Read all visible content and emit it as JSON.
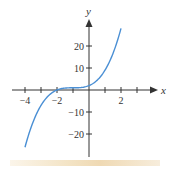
{
  "chart_data": {
    "type": "line",
    "title": "",
    "xlabel": "x",
    "ylabel": "y",
    "xlim": [
      -4.3,
      3.6
    ],
    "ylim": [
      -30,
      33
    ],
    "x_ticks": [
      -4,
      -3,
      -2,
      -1,
      0,
      1,
      2,
      3
    ],
    "x_tick_labels": [
      "−4",
      "−2",
      "2"
    ],
    "x_tick_label_values": [
      -4,
      -2,
      2
    ],
    "y_ticks": [
      -20,
      -10,
      10,
      20
    ],
    "y_tick_labels": [
      "−20",
      "−10",
      "10",
      "20"
    ],
    "grid": false,
    "legend": null,
    "series": [
      {
        "name": "y = (x+1)^3 + 1",
        "color": "#4a8fd4",
        "x": [
          -4,
          -3.5,
          -3,
          -2.5,
          -2,
          -1.5,
          -1,
          -0.5,
          0,
          0.5,
          1,
          1.5,
          2
        ],
        "y": [
          -26,
          -14.6,
          -7,
          -2.4,
          0,
          0.9,
          1,
          1.1,
          2,
          4.4,
          9,
          16.6,
          28
        ]
      }
    ]
  },
  "axes": {
    "x_name": "x",
    "y_name": "y",
    "labels": {
      "xm4": "−4",
      "xm2": "−2",
      "x2": "2",
      "y20": "20",
      "y10": "10",
      "ym10": "−10",
      "ym20": "−20"
    }
  },
  "colors": {
    "curve": "#4a8fd4",
    "axis": "#333333"
  }
}
